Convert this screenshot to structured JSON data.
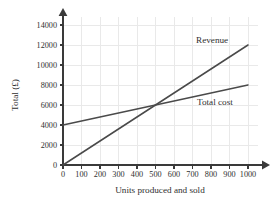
{
  "chart_data": {
    "type": "line",
    "title": "",
    "xlabel": "Units produced and sold",
    "ylabel": "Total (£)",
    "xlim": [
      0,
      1000
    ],
    "ylim": [
      0,
      14000
    ],
    "grid": true,
    "legend_position": "inline-right",
    "x_ticks": [
      "0",
      "100",
      "200",
      "300",
      "400",
      "500",
      "600",
      "700",
      "800",
      "900",
      "1000"
    ],
    "y_ticks": [
      "0",
      "2000",
      "4000",
      "6000",
      "8000",
      "10000",
      "12000",
      "14000"
    ],
    "x_tick_values": [
      0,
      100,
      200,
      300,
      400,
      500,
      600,
      700,
      800,
      900,
      1000
    ],
    "y_tick_values": [
      0,
      2000,
      4000,
      6000,
      8000,
      10000,
      12000,
      14000
    ],
    "series": [
      {
        "name": "Revenue",
        "label": "Revenue",
        "color": "#4a4a4a",
        "x": [
          0,
          1000
        ],
        "values": [
          0,
          12000
        ],
        "slope": 12,
        "intercept": 0
      },
      {
        "name": "Total cost",
        "label": "Total cost",
        "color": "#4a4a4a",
        "x": [
          0,
          1000
        ],
        "values": [
          4000,
          8000
        ],
        "slope": 4,
        "intercept": 4000
      }
    ],
    "annotations": [
      {
        "name": "break-even",
        "x": 500,
        "y": 6000
      }
    ]
  },
  "axes": {
    "x_title": "Units produced and sold",
    "y_title": "Total (£)"
  },
  "labels": {
    "revenue": "Revenue",
    "total_cost": "Total cost"
  },
  "colors": {
    "grid": "#e9e9e9",
    "axis": "#3a3a3a",
    "line": "#4a4a4a",
    "text": "#2f2f2f",
    "background": "#ffffff"
  }
}
